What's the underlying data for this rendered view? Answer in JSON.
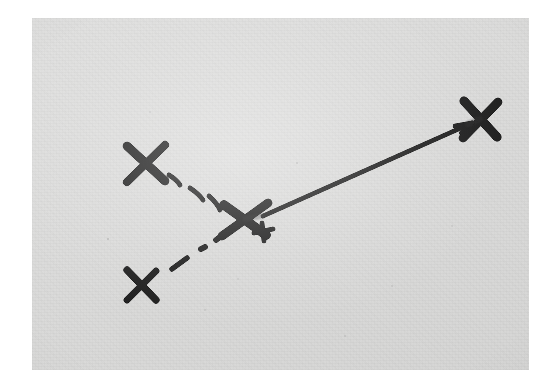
{
  "image": {
    "kind": "photograph-of-hand-drawn-diagram",
    "width": 554,
    "height": 390,
    "page_background": "#ffffff",
    "photo": {
      "left": 32,
      "top": 18,
      "width": 497,
      "height": 352,
      "paper_color": "#dcdcdb",
      "ink_color": "#141414"
    }
  },
  "chart_data": {
    "type": "scatter",
    "title": "",
    "subtitle": "",
    "xlabel": "",
    "ylabel": "",
    "grid": false,
    "legend": null,
    "annotations": [],
    "marks": [
      {
        "id": "x-upper-left",
        "label": "X",
        "glyph": "x-mark",
        "x": 145,
        "y": 163,
        "size": 42,
        "stroke_width": 8,
        "rotation_deg": -4,
        "weight": "heavy"
      },
      {
        "id": "x-lower-left",
        "label": "X",
        "glyph": "x-mark",
        "x": 141,
        "y": 285,
        "size": 34,
        "stroke_width": 7,
        "rotation_deg": 6,
        "weight": "medium"
      },
      {
        "id": "x-center",
        "label": "X",
        "glyph": "x-mark",
        "x": 244,
        "y": 219,
        "size": 44,
        "stroke_width": 9,
        "rotation_deg": -8,
        "weight": "heavy"
      },
      {
        "id": "x-upper-right",
        "label": "X",
        "glyph": "x-mark",
        "x": 481,
        "y": 118,
        "size": 46,
        "stroke_width": 9,
        "rotation_deg": 4,
        "weight": "heavy"
      },
      {
        "id": "plus-small-center",
        "label": "+",
        "glyph": "plus-mark",
        "x": 263,
        "y": 232,
        "size": 19,
        "stroke_width": 5,
        "rotation_deg": -10,
        "weight": "light"
      }
    ],
    "connectors": [
      {
        "id": "dashed-arc",
        "style": "dashed",
        "from": "x-upper-left",
        "to": "x-center",
        "stroke_width": 5,
        "dash_count": 4,
        "curved": true,
        "arrowhead": false,
        "path": "M 168 178 Q 196 190 234 212"
      },
      {
        "id": "dash-dot-line",
        "style": "dash-dot",
        "from": "x-lower-left",
        "to": "x-center",
        "stroke_width": 5,
        "curved": false,
        "arrowhead": false,
        "path": "M 172 268 L 236 225"
      },
      {
        "id": "solid-arrow",
        "style": "solid",
        "from": "x-center",
        "to": "x-upper-right",
        "stroke_width": 4.6,
        "curved": false,
        "arrowhead": true,
        "arrow_at": "x-upper-right",
        "path": "M 262 217 L 471 124"
      }
    ],
    "x": [
      145,
      141,
      244,
      481
    ],
    "y": [
      163,
      285,
      219,
      118
    ],
    "xlim": [
      32,
      529
    ],
    "ylim": [
      18,
      370
    ]
  },
  "accessibility": {
    "alt_text": "Black-and-white photograph of four hand-drawn X marks connected by a dashed curve, a dash-dot line, and a solid arrow pointing up and to the right."
  }
}
